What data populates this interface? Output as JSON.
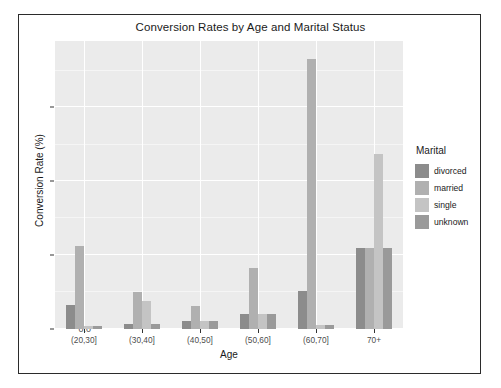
{
  "chart_data": {
    "type": "bar",
    "title": "Conversion Rates by Age and Marital Status",
    "xlabel": "Age",
    "ylabel": "Conversion Rate (%)",
    "categories": [
      "(20,30]",
      "(30,40]",
      "(40,50]",
      "(50,60]",
      "(60,70]",
      "70+"
    ],
    "series": [
      {
        "name": "divorced",
        "color": "#8c8c8c",
        "values": [
          0.033,
          0.007,
          0.011,
          0.021,
          0.052,
          0.11
        ]
      },
      {
        "name": "married",
        "color": "#b0b0b0",
        "values": [
          0.113,
          0.05,
          0.031,
          0.082,
          0.365,
          0.11
        ]
      },
      {
        "name": "single",
        "color": "#c4c4c4",
        "values": [
          0.004,
          0.038,
          0.011,
          0.021,
          0.005,
          0.237
        ]
      },
      {
        "name": "unknown",
        "color": "#9a9a9a",
        "values": [
          0.004,
          0.007,
          0.011,
          0.021,
          0.005,
          0.11
        ]
      }
    ],
    "ylim": [
      0.0,
      0.39
    ],
    "yticks": [
      0.0,
      0.1,
      0.2,
      0.3
    ],
    "ytick_labels": [
      "0.0",
      "0.1",
      "0.2",
      "0.3"
    ],
    "grid": true,
    "legend_title": "Marital",
    "legend_position": "right",
    "panel_background": "#ebebeb",
    "gridline_color": "#ffffff"
  }
}
